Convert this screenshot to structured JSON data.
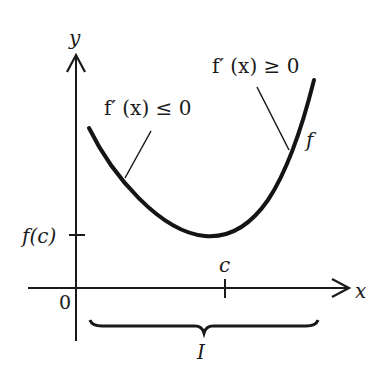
{
  "figure": {
    "axes": {
      "x_label": "x",
      "y_label": "y",
      "origin_label": "0"
    },
    "ticks": {
      "y_tick_label": "f(c)",
      "x_tick_label": "c"
    },
    "curve": {
      "label": "f"
    },
    "annotations": {
      "decreasing": "f′ (x) ≤ 0",
      "increasing": "f′ (x) ≥ 0"
    },
    "interval": {
      "label": "I"
    },
    "colors": {
      "ink": "#1a1a1a",
      "background": "#ffffff"
    }
  }
}
